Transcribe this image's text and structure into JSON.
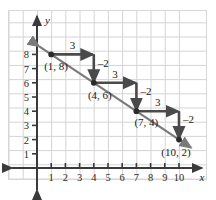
{
  "chart_data": {
    "type": "line",
    "title": "",
    "xlabel": "x",
    "ylabel": "y",
    "xlim": [
      0,
      10.6
    ],
    "ylim": [
      0,
      9.1
    ],
    "grid": true,
    "legend": null,
    "xticks": [
      1,
      2,
      3,
      4,
      5,
      6,
      7,
      8,
      9,
      10
    ],
    "yticks": [
      1,
      2,
      3,
      4,
      5,
      6,
      7,
      8
    ],
    "series": [
      {
        "name": "line",
        "x": [
          1,
          4,
          7,
          10
        ],
        "y": [
          8,
          6,
          4,
          2
        ],
        "slope": -0.6667,
        "extended_arrows": "both"
      }
    ],
    "points": [
      {
        "x": 1,
        "y": 8,
        "label": "(1, 8)"
      },
      {
        "x": 4,
        "y": 6,
        "label": "(4, 6)"
      },
      {
        "x": 7,
        "y": 4,
        "label": "(7, 4)"
      },
      {
        "x": 10,
        "y": 2,
        "label": "(10, 2)"
      }
    ],
    "step_annotations": [
      {
        "from": [
          1,
          8
        ],
        "run": 3,
        "rise": -2,
        "run_label": "3",
        "rise_label": "–2"
      },
      {
        "from": [
          4,
          6
        ],
        "run": 3,
        "rise": -2,
        "run_label": "3",
        "rise_label": "–2"
      },
      {
        "from": [
          7,
          4
        ],
        "run": 3,
        "rise": -2,
        "run_label": "3",
        "rise_label": "–2"
      }
    ],
    "colors": {
      "grid": "#d4d4d4",
      "axis": "#3a3a3a",
      "line": "#7a7a7a",
      "arrow": "#4a4a4a",
      "point": "#2b2b2b",
      "text": "#1a1a1a",
      "background": "#ffffff"
    }
  }
}
